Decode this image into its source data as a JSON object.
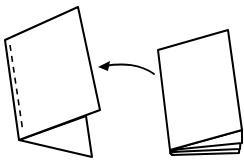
{
  "diagram": {
    "description": "Folding instruction illustration: a stacked booklet on the right is transformed (arrow pointing left) into a folded, stapled card standing as a tent on the left.",
    "colors": {
      "stroke": "#000000",
      "fill": "#ffffff",
      "background": "#ffffff"
    },
    "elements": {
      "folded_card": {
        "label": "folded-stapled-card",
        "has_dashed_staple_line": true
      },
      "arrow": {
        "label": "transform-arrow",
        "direction": "left"
      },
      "booklet": {
        "label": "stacked-booklet",
        "page_count_visible": 4
      }
    }
  }
}
